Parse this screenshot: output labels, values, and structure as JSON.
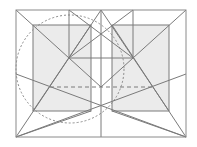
{
  "diagram": {
    "title": "",
    "colors": {
      "background": "#ffffff",
      "line": "#7a7a7a",
      "fill": "#ebebeb"
    },
    "frame": {
      "x1": 16,
      "y1": 10,
      "x2": 186,
      "y2": 137
    },
    "filled_rects": [
      {
        "name": "left-square",
        "x": 33,
        "y": 25,
        "w": 58,
        "h": 86
      },
      {
        "name": "right-square",
        "x": 112,
        "y": 25,
        "w": 57,
        "h": 86
      }
    ],
    "circle": {
      "cx": 70,
      "cy": 69,
      "r": 54
    },
    "dashed_lines": [
      {
        "x1": 50,
        "y1": 87,
        "x2": 152,
        "y2": 87
      }
    ],
    "lines": [
      {
        "x1": 16,
        "y1": 10,
        "x2": 101,
        "y2": 87
      },
      {
        "x1": 186,
        "y1": 10,
        "x2": 101,
        "y2": 87
      },
      {
        "x1": 69,
        "y1": 10,
        "x2": 69,
        "y2": 58
      },
      {
        "x1": 133,
        "y1": 10,
        "x2": 133,
        "y2": 58
      },
      {
        "x1": 101,
        "y1": 10,
        "x2": 101,
        "y2": 137
      },
      {
        "x1": 69,
        "y1": 10,
        "x2": 133,
        "y2": 58
      },
      {
        "x1": 133,
        "y1": 10,
        "x2": 69,
        "y2": 58
      },
      {
        "x1": 101,
        "y1": 10,
        "x2": 33,
        "y2": 111
      },
      {
        "x1": 101,
        "y1": 10,
        "x2": 169,
        "y2": 111
      },
      {
        "x1": 69,
        "y1": 58,
        "x2": 133,
        "y2": 58
      },
      {
        "x1": 16,
        "y1": 137,
        "x2": 91,
        "y2": 25
      },
      {
        "x1": 186,
        "y1": 137,
        "x2": 112,
        "y2": 25
      },
      {
        "x1": 16,
        "y1": 74,
        "x2": 186,
        "y2": 137
      },
      {
        "x1": 186,
        "y1": 74,
        "x2": 16,
        "y2": 137
      },
      {
        "x1": 16,
        "y1": 137,
        "x2": 91,
        "y2": 111
      },
      {
        "x1": 186,
        "y1": 137,
        "x2": 112,
        "y2": 111
      }
    ]
  }
}
